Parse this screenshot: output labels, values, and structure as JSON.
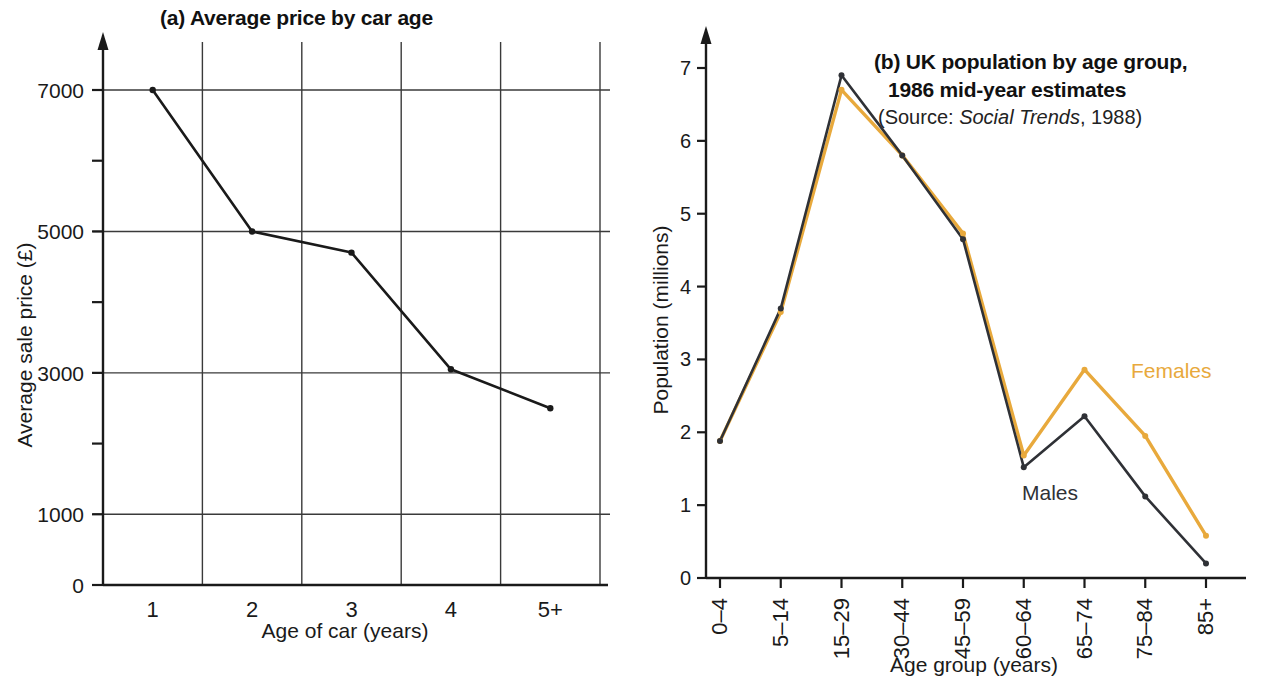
{
  "panel_a": {
    "title": "(a) Average price by car age",
    "ylabel": "Average sale price (£)",
    "xlabel": "Age of car (years)"
  },
  "panel_b": {
    "title_line1": "(b) UK population by age group,",
    "title_line2": "1986 mid-year estimates",
    "source_prefix": "(Source: ",
    "source_italic": "Social Trends",
    "source_suffix": ", 1988)",
    "ylabel": "Population (millions)",
    "xlabel": "Age group (years)",
    "legend_males": "Males",
    "legend_females": "Females",
    "color_males": "#2f3136",
    "color_females": "#e8a93c"
  },
  "chart_data": [
    {
      "type": "line",
      "title": "(a) Average price by car age",
      "xlabel": "Age of car (years)",
      "ylabel": "Average sale price (£)",
      "categories": [
        "1",
        "2",
        "3",
        "4",
        "5+"
      ],
      "values": [
        7000,
        5000,
        4700,
        3050,
        2500
      ],
      "ylim": [
        0,
        7600
      ],
      "ytick_labels": [
        "0",
        "1000",
        "3000",
        "5000",
        "7000"
      ],
      "ytick_values": [
        0,
        1000,
        3000,
        5000,
        7000
      ],
      "yminor_values": [
        2000,
        4000,
        6000
      ],
      "grid": true,
      "legend": "none"
    },
    {
      "type": "line",
      "title": "(b) UK population by age group, 1986 mid-year estimates",
      "subtitle": "(Source: Social Trends, 1988)",
      "xlabel": "Age group (years)",
      "ylabel": "Population (millions)",
      "categories": [
        "0–4",
        "5–14",
        "15–29",
        "30–44",
        "45–59",
        "60–64",
        "65–74",
        "75–84",
        "85+"
      ],
      "series": [
        {
          "name": "Males",
          "color": "#2f3136",
          "values": [
            1.88,
            3.7,
            6.9,
            5.8,
            4.65,
            1.52,
            2.22,
            1.12,
            0.2
          ]
        },
        {
          "name": "Females",
          "color": "#e8a93c",
          "values": [
            1.88,
            3.65,
            6.7,
            5.8,
            4.73,
            1.68,
            2.86,
            1.95,
            0.58
          ]
        }
      ],
      "ylim": [
        0,
        7.4
      ],
      "ytick_labels": [
        "0",
        "1",
        "2",
        "3",
        "4",
        "5",
        "6",
        "7"
      ],
      "ytick_values": [
        0,
        1,
        2,
        3,
        4,
        5,
        6,
        7
      ],
      "grid": false,
      "legend": "inline-annotations"
    }
  ]
}
